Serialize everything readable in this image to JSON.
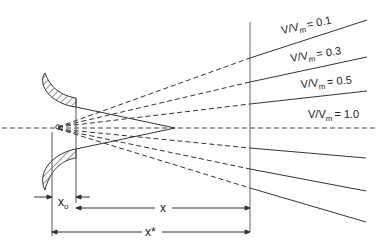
{
  "diagram": {
    "type": "jet spreading from nozzle (velocity ratio contours)",
    "ray_labels": [
      {
        "ratio": "V/V",
        "sub": "m",
        "value": "= 0.1"
      },
      {
        "ratio": "V/V",
        "sub": "m",
        "value": "= 0.3"
      },
      {
        "ratio": "V/V",
        "sub": "m",
        "value": "= 0.5"
      },
      {
        "ratio": "V/V",
        "sub": "m",
        "value": "= 1.0"
      }
    ],
    "dimensions": {
      "x0": {
        "symbol": "x",
        "sub": "o"
      },
      "x": {
        "symbol": "x"
      },
      "xstar": {
        "symbol": "x*"
      }
    },
    "colors": {
      "line": "#333333",
      "background": "#ffffff"
    }
  }
}
